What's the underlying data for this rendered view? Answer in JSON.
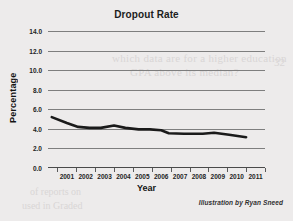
{
  "chart_data": {
    "type": "line",
    "title": "Dropout Rate",
    "xlabel": "Year",
    "ylabel": "Percentage",
    "xlim": [
      2000,
      2011.5
    ],
    "ylim": [
      0.0,
      14.0
    ],
    "grid": true,
    "legend": "none",
    "y_ticks": [
      "14.0",
      "12.0",
      "10.0",
      "8.0",
      "6.0",
      "4.0",
      "2.0",
      "0.0"
    ],
    "y_tick_values": [
      14.0,
      12.0,
      10.0,
      8.0,
      6.0,
      4.0,
      2.0,
      0.0
    ],
    "x_tick_labels": [
      "2001",
      "2002",
      "2003",
      "2004",
      "2005",
      "2006",
      "2007",
      "2008",
      "2009",
      "2010",
      "2011"
    ],
    "series": [
      {
        "name": "Dropout Rate",
        "color": "#1a1a1a",
        "x": [
          2000.2,
          2001.0,
          2001.6,
          2002.2,
          2002.8,
          2003.5,
          2004.1,
          2004.8,
          2005.4,
          2006.0,
          2006.4,
          2007.2,
          2008.2,
          2008.8,
          2009.6,
          2010.5
        ],
        "values": [
          5.2,
          4.6,
          4.2,
          4.1,
          4.1,
          4.35,
          4.1,
          3.95,
          3.95,
          3.85,
          3.55,
          3.5,
          3.5,
          3.6,
          3.4,
          3.15
        ]
      }
    ],
    "annotations": [
      "Illustration by Ryan Sneed"
    ]
  },
  "chart": {
    "title": "Dropout Rate",
    "x_axis_title": "Year",
    "y_axis_title": "Percentage",
    "credit": "Illustration by Ryan Sneed"
  },
  "background_ghost_text": {
    "line1": "which data are for a higher education",
    "line2": "GPA above its median?",
    "line3": "of reports on",
    "line4": "used in Graded",
    "line5": "32"
  }
}
